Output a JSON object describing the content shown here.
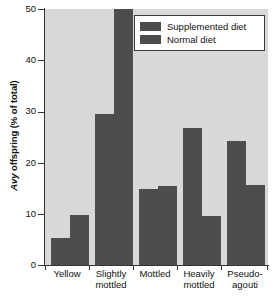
{
  "chart_data": {
    "type": "bar",
    "title": "",
    "xlabel": "",
    "ylabel": "Avy offspring (% of total)",
    "ylabel_italic_part": "Avy",
    "ylabel_rest": " offspring (% of total)",
    "ylim": [
      0,
      50
    ],
    "yticks": [
      0,
      10,
      20,
      30,
      40,
      50
    ],
    "ytick_labels": [
      "0",
      "10",
      "20",
      "30",
      "40",
      "50"
    ],
    "grid": false,
    "legend_position": "top-right",
    "categories": [
      "Yellow",
      "Slightly mottled",
      "Mottled",
      "Heavily mottled",
      "Pseudo-agouti"
    ],
    "category_lines": [
      [
        "Yellow"
      ],
      [
        "Slightly",
        "mottled"
      ],
      [
        "Mottled"
      ],
      [
        "Heavily",
        "mottled"
      ],
      [
        "Pseudo-",
        "agouti"
      ]
    ],
    "series": [
      {
        "name": "Supplemented diet",
        "color": "#4d4d4d",
        "values": [
          5.3,
          29.5,
          14.8,
          26.8,
          24.3
        ]
      },
      {
        "name": "Normal diet",
        "color": "#4d4d4d",
        "values": [
          9.7,
          50.0,
          15.5,
          9.5,
          15.6
        ]
      }
    ]
  },
  "legend": {
    "entries": [
      {
        "label": "Supplemented diet",
        "color": "#4d4d4d"
      },
      {
        "label": "Normal diet",
        "color": "#4d4d4d"
      }
    ]
  },
  "colors": {
    "plot_background": "#d8d8d8",
    "bar": "#4d4d4d",
    "axis": "#333333",
    "text": "#111111",
    "legend_background": "#ffffff",
    "legend_border": "#3a3a3a"
  }
}
